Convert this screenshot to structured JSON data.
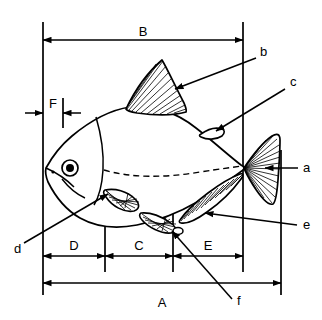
{
  "figure": {
    "kind": "fish-anatomy-measurement-diagram",
    "background": "#ffffff",
    "ink": "#000000",
    "width": 322,
    "height": 320
  },
  "dimensions": {
    "A": {
      "label": "A",
      "note": "total length",
      "x1": 43,
      "x2": 281,
      "y": 283,
      "label_x": 162,
      "label_y": 304
    },
    "B": {
      "label": "B",
      "note": "upper span",
      "x1": 43,
      "x2": 243,
      "y": 40,
      "label_x": 143,
      "label_y": 31
    },
    "C": {
      "label": "C",
      "note": "middle segment",
      "x1": 105,
      "x2": 173,
      "y": 256,
      "label_x": 139,
      "label_y": 247
    },
    "D": {
      "label": "D",
      "note": "head segment",
      "x1": 43,
      "x2": 105,
      "y": 256,
      "label_x": 74,
      "label_y": 247
    },
    "E": {
      "label": "E",
      "note": "tail segment",
      "x1": 173,
      "x2": 243,
      "y": 256,
      "label_x": 208,
      "label_y": 247
    },
    "F": {
      "label": "F",
      "note": "snout offset",
      "x1": 43,
      "x2": 63,
      "y": 113,
      "label_x": 53,
      "label_y": 104
    }
  },
  "callouts": [
    {
      "id": "a",
      "label": "a",
      "part": "caudal-fin",
      "text_x": 303,
      "text_y": 172,
      "lx1": 298,
      "ly1": 168,
      "lx2": 265,
      "ly2": 168
    },
    {
      "id": "b",
      "label": "b",
      "part": "dorsal-fin",
      "text_x": 260,
      "text_y": 56,
      "lx1": 256,
      "ly1": 58,
      "lx2": 175,
      "ly2": 89
    },
    {
      "id": "c",
      "label": "c",
      "part": "adipose-fin",
      "text_x": 290,
      "text_y": 86,
      "lx1": 285,
      "ly1": 89,
      "lx2": 216,
      "ly2": 131
    },
    {
      "id": "d",
      "label": "d",
      "part": "pectoral-fin",
      "text_x": 17,
      "text_y": 249,
      "lx1": 24,
      "ly1": 243,
      "lx2": 108,
      "ly2": 194
    },
    {
      "id": "e",
      "label": "e",
      "part": "anal-fin",
      "text_x": 303,
      "text_y": 228,
      "lx1": 297,
      "ly1": 225,
      "lx2": 205,
      "ly2": 213
    },
    {
      "id": "f",
      "label": "f",
      "part": "pelvic-fin",
      "text_x": 237,
      "text_y": 303,
      "lx1": 232,
      "ly1": 299,
      "lx2": 172,
      "ly2": 231
    }
  ],
  "guides": {
    "verticals": [
      {
        "name": "guide-left-origin",
        "x": 43,
        "y1": 22,
        "y2": 295
      },
      {
        "name": "guide-snout-offset",
        "x": 63,
        "y1": 98,
        "y2": 128
      },
      {
        "name": "guide-d-c-split",
        "x": 105,
        "y1": 182,
        "y2": 272
      },
      {
        "name": "guide-c-e-split",
        "x": 173,
        "y1": 204,
        "y2": 272
      },
      {
        "name": "guide-b-right",
        "x": 243,
        "y1": 22,
        "y2": 272
      },
      {
        "name": "guide-a-right",
        "x": 281,
        "y1": 150,
        "y2": 295
      }
    ]
  },
  "fish": {
    "eye": {
      "cx": 70,
      "cy": 168,
      "r_outer": 8,
      "r_pupil": 4
    },
    "nostril": {
      "cx": 53,
      "cy": 172,
      "r": 1.6
    },
    "lateral_line": "dashed"
  }
}
